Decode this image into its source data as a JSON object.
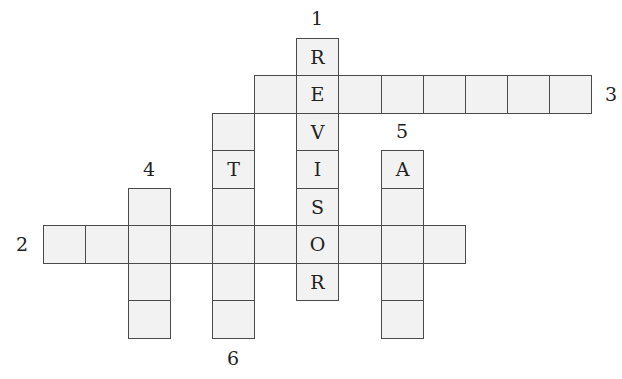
{
  "puzzle": {
    "type": "crossword",
    "cell_fill_color": "#f2f2f2",
    "cell_border_color": "#4a4a4a",
    "text_color": "#222222",
    "grid": {
      "col_edges": [
        43,
        85,
        128,
        170,
        212,
        254,
        296,
        338,
        381,
        423,
        465,
        507,
        549,
        591
      ],
      "row_edges": [
        38,
        75,
        113,
        150,
        188,
        225,
        263,
        300,
        338
      ]
    },
    "words": [
      {
        "number": "1",
        "direction": "down",
        "start_col": 6,
        "start_row": 0,
        "length": 7,
        "letters": [
          "R",
          "E",
          "V",
          "I",
          "S",
          "O",
          "R"
        ],
        "label_pos": [
          317,
          18
        ]
      },
      {
        "number": "3",
        "direction": "across",
        "start_col": 5,
        "start_row": 1,
        "length": 8,
        "letters": [
          "",
          "",
          "",
          "",
          "",
          "",
          "",
          ""
        ],
        "label_pos": [
          611,
          94
        ]
      },
      {
        "number": "6",
        "direction": "down",
        "start_col": 4,
        "start_row": 2,
        "length": 6,
        "letters": [
          "",
          "T",
          "",
          "",
          "",
          ""
        ],
        "label_pos": [
          233,
          358
        ]
      },
      {
        "number": "5",
        "direction": "down",
        "start_col": 8,
        "start_row": 3,
        "length": 5,
        "letters": [
          "A",
          "",
          "",
          "",
          ""
        ],
        "label_pos": [
          402,
          131
        ]
      },
      {
        "number": "4",
        "direction": "down",
        "start_col": 2,
        "start_row": 4,
        "length": 4,
        "letters": [
          "",
          "",
          "",
          ""
        ],
        "label_pos": [
          149,
          169
        ]
      },
      {
        "number": "2",
        "direction": "across",
        "start_col": 0,
        "start_row": 5,
        "length": 10,
        "letters": [
          "",
          "",
          "",
          "",
          "",
          "",
          "O",
          "",
          "",
          ""
        ],
        "label_pos": [
          22,
          244
        ]
      }
    ]
  }
}
